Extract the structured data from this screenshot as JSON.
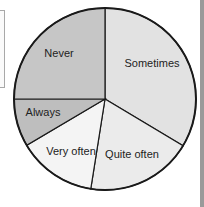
{
  "chart_data": {
    "type": "pie",
    "title": "",
    "start_angle_deg": 90,
    "direction": "clockwise",
    "slices": [
      {
        "label": "Sometimes",
        "share_pct": 33.6,
        "color": "#e2e2e2"
      },
      {
        "label": "Quite often",
        "share_pct": 18.9,
        "color": "#ebebeb"
      },
      {
        "label": "Very often",
        "share_pct": 14.0,
        "color": "#f4f4f4"
      },
      {
        "label": "Always",
        "share_pct": 8.5,
        "color": "#bebebe"
      },
      {
        "label": "Never",
        "share_pct": 25.0,
        "color": "#c6c6c6"
      }
    ],
    "legend": "none (labels inside slices)"
  },
  "labels": {
    "sometimes": "Sometimes",
    "quite_often": "Quite often",
    "very_often": "Very often",
    "always": "Always",
    "never": "Never"
  }
}
